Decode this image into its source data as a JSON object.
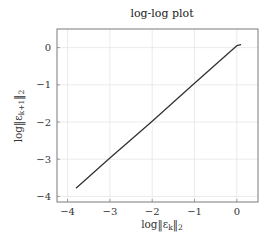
{
  "chart_data": {
    "type": "line",
    "title": "log-log plot",
    "xlabel": "log‖ε_k‖₂",
    "ylabel": "log‖ε_{k+1}‖₂",
    "xlim": [
      -4.25,
      0.5
    ],
    "ylim": [
      -4.15,
      0.5
    ],
    "xticks": [
      -4,
      -3,
      -2,
      -1,
      0
    ],
    "yticks": [
      -4,
      -3,
      -2,
      -1,
      0
    ],
    "xtick_labels": [
      "−4",
      "−3",
      "−2",
      "−1",
      "0"
    ],
    "ytick_labels": [
      "−4",
      "−3",
      "−2",
      "−1",
      "0"
    ],
    "grid": true,
    "legend": null,
    "series": [
      {
        "name": "log-log",
        "color": "#333333",
        "x": [
          -3.8,
          -3.0,
          -2.0,
          -1.0,
          0.0,
          0.1
        ],
        "y": [
          -3.78,
          -2.97,
          -1.98,
          -0.96,
          0.05,
          0.08
        ]
      }
    ]
  },
  "text": {
    "title": "log-log plot",
    "xlabel_main": "log‖ε",
    "xlabel_sub": "k",
    "xlabel_tail": "‖",
    "xlabel_norm": "2",
    "ylabel_main": "log‖ε",
    "ylabel_sub": "k+1",
    "ylabel_tail": "‖",
    "ylabel_norm": "2"
  }
}
